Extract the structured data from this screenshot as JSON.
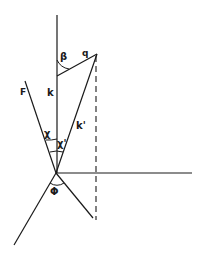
{
  "diagram": {
    "type": "vector-geometry",
    "labels": {
      "beta": "β",
      "q": "q",
      "k": "k",
      "k_prime": "k'",
      "F": "F",
      "chi": "χ",
      "chi_prime": "χ'",
      "phi": "Φ"
    },
    "colors": {
      "line": "#1a1a1a",
      "background": "#ffffff"
    }
  }
}
